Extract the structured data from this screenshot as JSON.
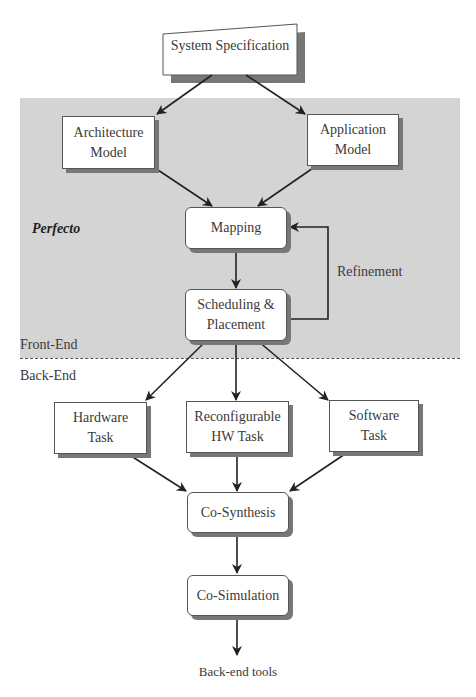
{
  "diagram": {
    "region": {
      "color": "#d4d4d4",
      "label": "Perfecto"
    },
    "phases": {
      "front": "Front-End",
      "back": "Back-End"
    },
    "nodes": {
      "spec": {
        "label": "System Specification"
      },
      "arch": {
        "line1": "Architecture",
        "line2": "Model"
      },
      "app": {
        "line1": "Application",
        "line2": "Model"
      },
      "mapping": {
        "label": "Mapping"
      },
      "sched": {
        "line1": "Scheduling &",
        "line2": "Placement"
      },
      "hw": {
        "line1": "Hardware",
        "line2": "Task"
      },
      "rhw": {
        "line1": "Reconfigurable",
        "line2": "HW Task"
      },
      "sw": {
        "line1": "Software",
        "line2": "Task"
      },
      "cosyn": {
        "label": "Co-Synthesis"
      },
      "cosim": {
        "label": "Co-Simulation"
      }
    },
    "loop_label": "Refinement",
    "output_label": "Back-end tools",
    "edges": [
      [
        "System Specification",
        "Architecture Model"
      ],
      [
        "System Specification",
        "Application Model"
      ],
      [
        "Architecture Model",
        "Mapping"
      ],
      [
        "Application Model",
        "Mapping"
      ],
      [
        "Mapping",
        "Scheduling & Placement"
      ],
      [
        "Scheduling & Placement",
        "Mapping"
      ],
      [
        "Scheduling & Placement",
        "Hardware Task"
      ],
      [
        "Scheduling & Placement",
        "Reconfigurable HW Task"
      ],
      [
        "Scheduling & Placement",
        "Software Task"
      ],
      [
        "Hardware Task",
        "Co-Synthesis"
      ],
      [
        "Reconfigurable HW Task",
        "Co-Synthesis"
      ],
      [
        "Software Task",
        "Co-Synthesis"
      ],
      [
        "Co-Synthesis",
        "Co-Simulation"
      ],
      [
        "Co-Simulation",
        "Back-end tools"
      ]
    ]
  }
}
